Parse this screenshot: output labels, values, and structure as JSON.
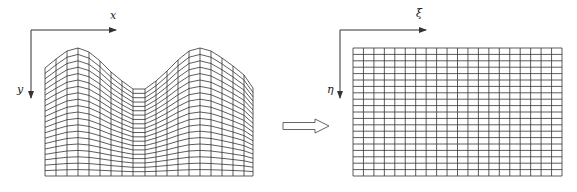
{
  "physical_domain": {
    "axes": {
      "x_label": "x",
      "y_label": "y",
      "origin": [
        31,
        30
      ],
      "x_arrow_end": 116,
      "y_arrow_end": 98,
      "x_label_pos": [
        110,
        10
      ],
      "y_label_pos": [
        17,
        84
      ]
    },
    "grid": {
      "left": 45,
      "right": 253,
      "bottom": 176,
      "columns": 19,
      "rows": 20,
      "top_profile": [
        [
          45,
          68
        ],
        [
          56,
          59
        ],
        [
          67,
          51
        ],
        [
          78,
          48
        ],
        [
          89,
          52
        ],
        [
          100,
          61
        ],
        [
          111,
          72
        ],
        [
          122,
          81
        ],
        [
          133,
          89
        ],
        [
          145,
          89
        ],
        [
          156,
          81
        ],
        [
          167,
          71
        ],
        [
          178,
          60
        ],
        [
          189,
          51
        ],
        [
          200,
          48
        ],
        [
          211,
          51
        ],
        [
          222,
          58
        ],
        [
          233,
          66
        ],
        [
          244,
          75
        ],
        [
          253,
          88
        ]
      ]
    }
  },
  "computational_domain": {
    "axes": {
      "x_label": "ξ",
      "y_label": "η",
      "origin": [
        340,
        30
      ],
      "x_arrow_end": 426,
      "y_arrow_end": 98,
      "x_label_pos": [
        416,
        8
      ],
      "y_label_pos": [
        327,
        84
      ]
    },
    "grid": {
      "left": 353,
      "right": 562,
      "top": 48,
      "bottom": 176,
      "columns": 20,
      "rows": 20
    }
  },
  "transform_arrow": {
    "x_start": 283,
    "x_end": 329,
    "y_center": 126
  },
  "colors": {
    "line": "#333333",
    "background": "#ffffff"
  }
}
